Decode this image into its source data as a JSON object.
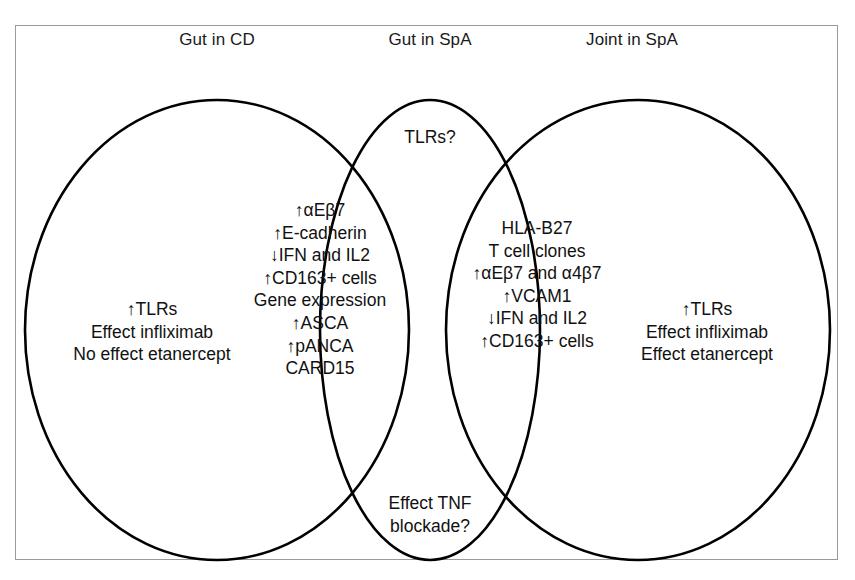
{
  "figure": {
    "type": "venn-diagram",
    "circle_count": 3,
    "stroke_color": "#000000",
    "frame_color": "#9a9a9a",
    "background": "#ffffff"
  },
  "headers": {
    "left": "Gut in CD",
    "center": "Gut in SpA",
    "right": "Joint in SpA"
  },
  "regions": {
    "top_overlap_label": "TLRs?",
    "bottom_overlap_label_line1": "Effect TNF",
    "bottom_overlap_label_line2": "blockade?",
    "left_only": {
      "lines": [
        "↑TLRs",
        "Effect infliximab",
        "No effect etanercept"
      ]
    },
    "left_center_overlap": {
      "lines": [
        "↑αEβ7",
        "↑E-cadherin",
        "↓IFN and IL2",
        "↑CD163+ cells",
        "Gene expression",
        "↑ASCA",
        "↑pANCA",
        "CARD15"
      ]
    },
    "center_right_overlap": {
      "lines": [
        "HLA-B27",
        "T cell clones",
        "↑αEβ7 and α4β7",
        "↑VCAM1",
        "↓IFN and IL2",
        "↑CD163+ cells"
      ]
    },
    "right_only": {
      "lines": [
        "↑TLRs",
        "Effect infliximab",
        "Effect etanercept"
      ]
    }
  }
}
